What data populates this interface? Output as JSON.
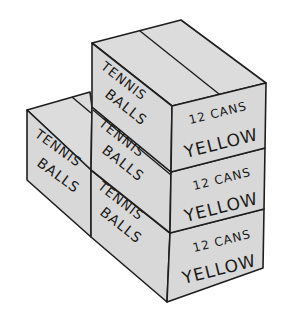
{
  "illustration": {
    "description": "Stacked cardboard boxes of tennis balls",
    "colors": {
      "box_fill": "#d8d8d8",
      "outline": "#1e1e1e",
      "background": "#ffffff"
    },
    "boxes": [
      {
        "id": "top",
        "end_label_1": "TENNIS",
        "end_label_2": "BALLS",
        "side_label_1": "12 CANS",
        "side_label_2": "YELLOW"
      },
      {
        "id": "middle",
        "end_label_1": "TENNIS",
        "end_label_2": "BALLS",
        "side_label_1": "12 CANS",
        "side_label_2": "YELLOW"
      },
      {
        "id": "bottom",
        "end_label_1": "TENNIS",
        "end_label_2": "BALLS",
        "side_label_1": "12 CANS",
        "side_label_2": "YELLOW"
      },
      {
        "id": "left",
        "end_label_1": "TENNIS",
        "end_label_2": "BALLS"
      }
    ]
  }
}
